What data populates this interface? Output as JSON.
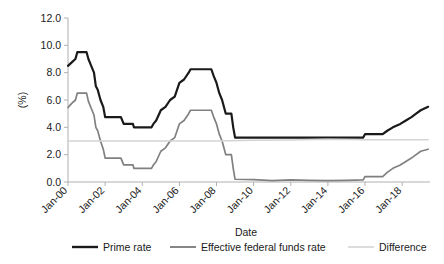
{
  "chart_data": {
    "type": "line",
    "title": "",
    "xlabel": "Date",
    "ylabel": "(%)",
    "ylim": [
      0.0,
      12.0
    ],
    "ytick_step": 2.0,
    "ytick_labels": [
      "0.0",
      "2.0",
      "4.0",
      "6.0",
      "8.0",
      "10.0",
      "12.0"
    ],
    "ytick_values": [
      0.0,
      2.0,
      4.0,
      6.0,
      8.0,
      10.0,
      12.0
    ],
    "xtick_labels": [
      "Jan-00",
      "Jan-02",
      "Jan-04",
      "Jan-06",
      "Jan-08",
      "Jan-10",
      "Jan-12",
      "Jan-14",
      "Jan-16",
      "Jan-18"
    ],
    "xtick_values": [
      2000,
      2002,
      2004,
      2006,
      2008,
      2010,
      2012,
      2014,
      2016,
      2018
    ],
    "xlim": [
      2000,
      2019.5
    ],
    "xtick_rotation": 45,
    "grid": false,
    "legend_position": "bottom",
    "colors": {
      "prime_rate": "#1a1a1a",
      "effective_federal_funds_rate": "#808080",
      "difference": "#d4d4d4"
    },
    "series": [
      {
        "name": "Prime rate",
        "color": "#1a1a1a",
        "x": [
          2000.0,
          2000.2,
          2000.4,
          2000.5,
          2000.9,
          2001.0,
          2001.1,
          2001.25,
          2001.4,
          2001.5,
          2001.6,
          2001.75,
          2001.9,
          2002.0,
          2002.2,
          2002.85,
          2003.0,
          2003.5,
          2003.55,
          2004.0,
          2004.5,
          2004.6,
          2004.75,
          2005.0,
          2005.25,
          2005.5,
          2005.75,
          2006.0,
          2006.25,
          2006.5,
          2006.6,
          2007.0,
          2007.5,
          2007.72,
          2007.85,
          2008.0,
          2008.15,
          2008.3,
          2008.5,
          2008.8,
          2008.9,
          2009.0,
          2010.0,
          2011.0,
          2012.0,
          2013.0,
          2014.0,
          2015.0,
          2015.9,
          2016.0,
          2016.5,
          2016.95,
          2017.2,
          2017.5,
          2017.9,
          2018.2,
          2018.5,
          2018.75,
          2019.0,
          2019.4
        ],
        "y": [
          8.5,
          8.75,
          9.0,
          9.5,
          9.5,
          9.5,
          9.0,
          8.5,
          8.0,
          7.0,
          6.75,
          6.0,
          5.5,
          4.75,
          4.75,
          4.75,
          4.25,
          4.25,
          4.0,
          4.0,
          4.0,
          4.25,
          4.5,
          5.25,
          5.5,
          6.0,
          6.25,
          7.25,
          7.5,
          8.0,
          8.25,
          8.25,
          8.25,
          8.25,
          7.75,
          7.25,
          6.5,
          6.0,
          5.0,
          5.0,
          4.0,
          3.25,
          3.25,
          3.25,
          3.25,
          3.25,
          3.25,
          3.25,
          3.25,
          3.5,
          3.5,
          3.5,
          3.75,
          4.0,
          4.25,
          4.5,
          4.75,
          5.0,
          5.25,
          5.5
        ]
      },
      {
        "name": "Effective federal funds rate",
        "color": "#808080",
        "x": [
          2000.0,
          2000.2,
          2000.4,
          2000.5,
          2000.9,
          2001.0,
          2001.1,
          2001.25,
          2001.4,
          2001.5,
          2001.6,
          2001.75,
          2001.9,
          2002.0,
          2002.2,
          2002.85,
          2003.0,
          2003.5,
          2003.55,
          2004.0,
          2004.5,
          2004.6,
          2004.75,
          2005.0,
          2005.25,
          2005.5,
          2005.75,
          2006.0,
          2006.25,
          2006.5,
          2006.6,
          2007.0,
          2007.5,
          2007.72,
          2007.85,
          2008.0,
          2008.15,
          2008.3,
          2008.5,
          2008.8,
          2008.9,
          2009.0,
          2010.0,
          2011.0,
          2012.0,
          2013.0,
          2014.0,
          2015.0,
          2015.9,
          2016.0,
          2016.5,
          2016.95,
          2017.2,
          2017.5,
          2017.9,
          2018.2,
          2018.5,
          2018.75,
          2019.0,
          2019.4
        ],
        "y": [
          5.45,
          5.75,
          6.0,
          6.5,
          6.5,
          6.5,
          5.9,
          5.4,
          4.9,
          4.0,
          3.75,
          3.0,
          2.4,
          1.75,
          1.75,
          1.75,
          1.25,
          1.25,
          1.0,
          1.0,
          1.0,
          1.25,
          1.5,
          2.25,
          2.5,
          3.0,
          3.25,
          4.25,
          4.5,
          5.0,
          5.25,
          5.25,
          5.25,
          5.25,
          4.75,
          4.25,
          3.5,
          3.0,
          2.0,
          2.0,
          1.0,
          0.2,
          0.18,
          0.1,
          0.15,
          0.12,
          0.1,
          0.12,
          0.15,
          0.4,
          0.4,
          0.4,
          0.7,
          1.0,
          1.25,
          1.5,
          1.75,
          2.0,
          2.25,
          2.4
        ]
      },
      {
        "name": "Difference",
        "color": "#d4d4d4",
        "x": [
          2000.0,
          2002.0,
          2004.0,
          2006.0,
          2008.0,
          2010.0,
          2012.0,
          2014.0,
          2016.0,
          2018.0,
          2019.4
        ],
        "y": [
          3.0,
          3.0,
          3.0,
          3.0,
          3.0,
          3.05,
          3.07,
          3.13,
          3.1,
          3.1,
          3.1
        ]
      }
    ]
  },
  "legend": {
    "items": [
      {
        "label": "Prime rate",
        "color": "#1a1a1a"
      },
      {
        "label": "Effective federal funds rate",
        "color": "#808080"
      },
      {
        "label": "Difference",
        "color": "#d4d4d4"
      }
    ]
  }
}
